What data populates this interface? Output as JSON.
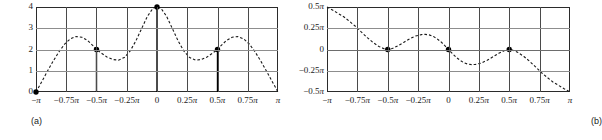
{
  "figure": {
    "panels": [
      {
        "caption": "(a)"
      },
      {
        "caption": "(b)"
      }
    ]
  },
  "chart_data": [
    {
      "type": "line",
      "title": "",
      "panel_label": "(a)",
      "xlabel": "",
      "ylabel": "",
      "xlim": [
        -3.14159265,
        3.14159265
      ],
      "ylim": [
        0,
        4
      ],
      "grid": true,
      "legend": null,
      "line_style": "dashed",
      "xtick_labels": [
        "−π",
        "−0.75π",
        "−0.5π",
        "−0.25π",
        "0",
        "0.25π",
        "0.5π",
        "0.75π",
        "π"
      ],
      "xtick_values": [
        -3.14159265,
        -2.35619449,
        -1.57079633,
        -0.78539816,
        0,
        0.78539816,
        1.57079633,
        2.35619449,
        3.14159265
      ],
      "ytick_labels": [
        "0",
        "1",
        "2",
        "3",
        "4"
      ],
      "ytick_values": [
        0,
        1,
        2,
        3,
        4
      ],
      "series": [
        {
          "name": "magnitude",
          "x": [
            -3.14159,
            -3.0,
            -2.85,
            -2.7,
            -2.55,
            -2.4,
            -2.25,
            -2.1,
            -1.95,
            -1.8,
            -1.65,
            -1.5708,
            -1.45,
            -1.3,
            -1.15,
            -1.0,
            -0.85,
            -0.7,
            -0.55,
            -0.4,
            -0.25,
            -0.1,
            0.0,
            0.1,
            0.25,
            0.4,
            0.55,
            0.7,
            0.85,
            1.0,
            1.15,
            1.3,
            1.45,
            1.5708,
            1.65,
            1.8,
            1.95,
            2.1,
            2.25,
            2.4,
            2.55,
            2.7,
            2.85,
            3.0,
            3.14159
          ],
          "y": [
            0.0,
            0.46,
            0.96,
            1.44,
            1.88,
            2.25,
            2.5,
            2.61,
            2.58,
            2.42,
            2.16,
            2.0,
            1.84,
            1.65,
            1.53,
            1.5,
            1.62,
            1.92,
            2.4,
            2.98,
            3.56,
            3.95,
            4.0,
            3.95,
            3.56,
            2.98,
            2.4,
            1.92,
            1.62,
            1.5,
            1.53,
            1.65,
            1.84,
            2.0,
            2.16,
            2.42,
            2.58,
            2.61,
            2.5,
            2.25,
            1.88,
            1.44,
            0.96,
            0.46,
            0.0
          ]
        }
      ],
      "stems": [
        {
          "x": -1.57079633,
          "y": 2,
          "label": "-0.5π"
        },
        {
          "x": 0,
          "y": 4,
          "label": "0"
        },
        {
          "x": 1.57079633,
          "y": 2,
          "label": "0.5π"
        }
      ],
      "markers": [
        {
          "x": -3.14159265,
          "y": 0
        },
        {
          "x": -1.57079633,
          "y": 2
        },
        {
          "x": 0,
          "y": 4
        },
        {
          "x": 1.57079633,
          "y": 2
        }
      ]
    },
    {
      "type": "line",
      "title": "",
      "panel_label": "(b)",
      "xlabel": "",
      "ylabel": "",
      "xlim": [
        -3.14159265,
        3.14159265
      ],
      "ylim": [
        -1.57079633,
        1.57079633
      ],
      "grid": true,
      "legend": null,
      "line_style": "dashed",
      "xtick_labels": [
        "−π",
        "−0.75π",
        "−0.5π",
        "−0.25π",
        "0",
        "0.25π",
        "0.5π",
        "0.75π",
        "π"
      ],
      "xtick_values": [
        -3.14159265,
        -2.35619449,
        -1.57079633,
        -0.78539816,
        0,
        0.78539816,
        1.57079633,
        2.35619449,
        3.14159265
      ],
      "ytick_labels": [
        "0.5π",
        "0.25π",
        "0",
        "−0.25π",
        "−0.5π"
      ],
      "ytick_values": [
        1.57079633,
        0.78539816,
        0,
        -0.78539816,
        -1.57079633
      ],
      "series": [
        {
          "name": "phase",
          "x": [
            -3.14159,
            -3.0,
            -2.85,
            -2.7,
            -2.55,
            -2.4,
            -2.25,
            -2.1,
            -1.95,
            -1.8,
            -1.65,
            -1.5708,
            -1.45,
            -1.3,
            -1.15,
            -1.0,
            -0.85,
            -0.7,
            -0.6,
            -0.5,
            -0.4,
            -0.3,
            -0.2,
            -0.1,
            0.0,
            0.1,
            0.2,
            0.3,
            0.4,
            0.5,
            0.6,
            0.7,
            0.85,
            1.0,
            1.15,
            1.3,
            1.45,
            1.5708,
            1.65,
            1.8,
            1.95,
            2.1,
            2.25,
            2.4,
            2.55,
            2.7,
            2.85,
            3.0,
            3.14159
          ],
          "y": [
            1.5708,
            1.46,
            1.33,
            1.2,
            1.03,
            0.85,
            0.64,
            0.44,
            0.26,
            0.11,
            0.02,
            0.0,
            0.04,
            0.14,
            0.27,
            0.4,
            0.5,
            0.55,
            0.56,
            0.54,
            0.49,
            0.4,
            0.29,
            0.15,
            0.0,
            -0.15,
            -0.29,
            -0.4,
            -0.49,
            -0.54,
            -0.56,
            -0.55,
            -0.5,
            -0.4,
            -0.27,
            -0.14,
            -0.04,
            0.0,
            -0.02,
            -0.11,
            -0.26,
            -0.44,
            -0.64,
            -0.85,
            -1.03,
            -1.2,
            -1.33,
            -1.46,
            -1.5708
          ]
        }
      ],
      "stems": [],
      "markers": [
        {
          "x": -1.57079633,
          "y": 0
        },
        {
          "x": 0,
          "y": 0
        },
        {
          "x": 1.57079633,
          "y": 0
        }
      ]
    }
  ]
}
